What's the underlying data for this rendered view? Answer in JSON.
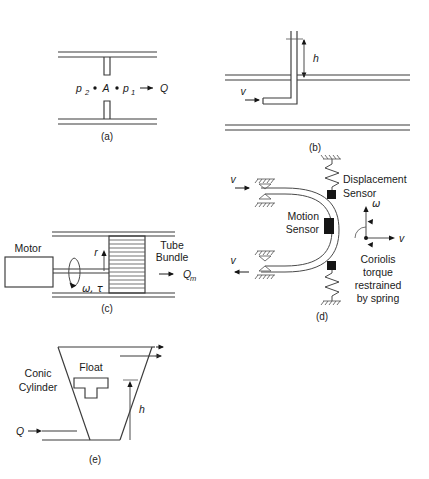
{
  "figure": {
    "panel_count": 5,
    "background_color": "#ffffff",
    "line_color": "#3a3a3a"
  },
  "panels": [
    {
      "id": "a",
      "caption": "(a)",
      "device": "orifice-plate-flowmeter",
      "labels": {
        "p2": "p",
        "p2_sub": "2",
        "area": "A",
        "p1": "p",
        "p1_sub": "1",
        "flow": "Q",
        "arrow": "→"
      }
    },
    {
      "id": "b",
      "caption": "(b)",
      "device": "pitot-tube",
      "labels": {
        "height": "h",
        "velocity": "v"
      }
    },
    {
      "id": "c",
      "caption": "(c)",
      "device": "angular-momentum-mass-flowmeter",
      "labels": {
        "motor": "Motor",
        "tube_bundle_line1": "Tube",
        "tube_bundle_line2": "Bundle",
        "radius": "r",
        "omega_tau": "ω, τ",
        "mass_flow": "Q",
        "mass_flow_sub": "m"
      }
    },
    {
      "id": "d",
      "caption": "(d)",
      "device": "coriolis-mass-flowmeter",
      "labels": {
        "velocity_top": "v",
        "velocity_bottom": "v",
        "displacement_sensor_line1": "Displacement",
        "displacement_sensor_line2": "Sensor",
        "motion_sensor_line1": "Motion",
        "motion_sensor_line2": "Sensor",
        "omega": "ω",
        "v_axis": "v",
        "note_line1": "Coriolis",
        "note_line2": "torque",
        "note_line3": "restrained",
        "note_line4": "by spring"
      }
    },
    {
      "id": "e",
      "caption": "(e)",
      "device": "rotameter-variable-area-flowmeter",
      "labels": {
        "conic_line1": "Conic",
        "conic_line2": "Cylinder",
        "float": "Float",
        "height": "h",
        "flow": "Q"
      }
    }
  ]
}
